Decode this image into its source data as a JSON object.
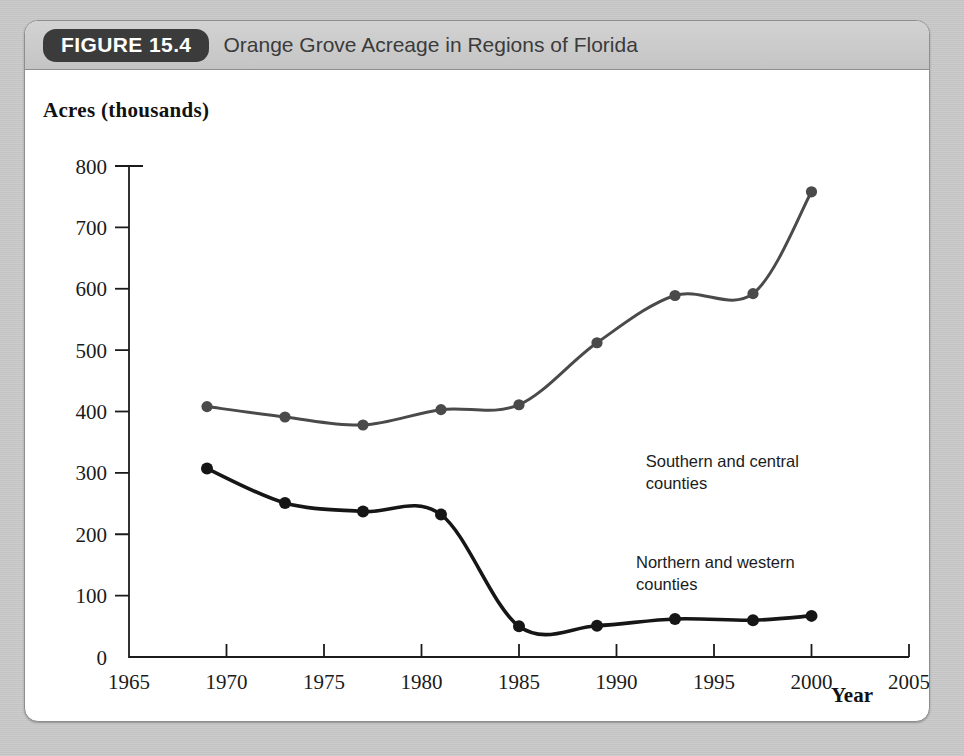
{
  "figure": {
    "badge": "FIGURE 15.4",
    "title": "Orange Grove Acreage in Regions of Florida"
  },
  "axis": {
    "ylabel": "Acres (thousands)",
    "xlabel": "Year"
  },
  "chart_data": {
    "type": "line",
    "title": "Orange Grove Acreage in Regions of Florida",
    "xlabel": "Year",
    "ylabel": "Acres (thousands)",
    "xlim": [
      1965,
      2005
    ],
    "ylim": [
      0,
      800
    ],
    "xticks": [
      1965,
      1970,
      1975,
      1980,
      1985,
      1990,
      1995,
      2000,
      2005
    ],
    "yticks": [
      0,
      100,
      200,
      300,
      400,
      500,
      600,
      700,
      800
    ],
    "xtick_labels": [
      "1965",
      "1970",
      "1975",
      "1980",
      "1985",
      "1990",
      "1995",
      "2000",
      "2005"
    ],
    "ytick_labels": [
      "0",
      "100",
      "200",
      "300",
      "400",
      "500",
      "600",
      "700",
      "800"
    ],
    "grid": false,
    "legend": "annotations",
    "series": [
      {
        "name": "Southern and central counties",
        "color": "#4a4a4a",
        "x": [
          1969,
          1973,
          1977,
          1981,
          1985,
          1989,
          1993,
          1997,
          2000
        ],
        "values": [
          408,
          391,
          378,
          403,
          411,
          512,
          589,
          592,
          758
        ],
        "annotation": "Southern and central\ncounties",
        "annotation_lines": [
          "Southern and central",
          "counties"
        ],
        "annotation_x": 1991.5,
        "annotation_y": 310
      },
      {
        "name": "Northern and western counties",
        "color": "#161616",
        "x": [
          1969,
          1973,
          1977,
          1981,
          1985,
          1989,
          1993,
          1997,
          2000
        ],
        "values": [
          307,
          251,
          237,
          232,
          50,
          51,
          62,
          60,
          67
        ],
        "annotation": "Northern and western\ncounties",
        "annotation_lines": [
          "Northern and western",
          "counties"
        ],
        "annotation_x": 1991.0,
        "annotation_y": 145
      }
    ]
  },
  "colors": {
    "page_background": "#c9c9c9",
    "figure_background": "#ffffff",
    "header_band": "#cbcbcb",
    "badge_background": "#3b3b3b",
    "badge_text": "#ffffff",
    "title_text": "#3b3b3b",
    "axis": "#1b1b1b",
    "series_upper": "#4a4a4a",
    "series_lower": "#161616"
  }
}
